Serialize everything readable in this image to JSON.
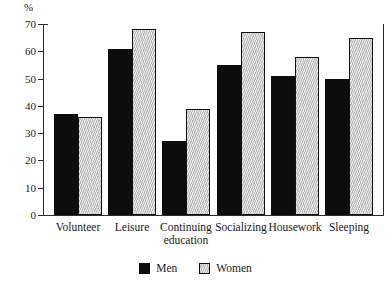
{
  "chart_data": {
    "type": "bar",
    "title": "",
    "subtitle": "",
    "xlabel": "",
    "ylabel": "%",
    "ylim": [
      0,
      70
    ],
    "ytick_labels": [
      "0",
      "10",
      "20",
      "30",
      "40",
      "50",
      "60",
      "70"
    ],
    "ytick_values": [
      0,
      10,
      20,
      30,
      40,
      50,
      60,
      70
    ],
    "grid": false,
    "legend_position": "bottom-center",
    "categories": [
      "Volunteer",
      "Leisure",
      "Continuing education",
      "Socializing",
      "Housework",
      "Sleeping"
    ],
    "category_lines": [
      [
        "Volunteer",
        ""
      ],
      [
        "Leisure",
        ""
      ],
      [
        "Continuing",
        "education"
      ],
      [
        "Socializing",
        ""
      ],
      [
        "Housework",
        ""
      ],
      [
        "Sleeping",
        ""
      ]
    ],
    "series": [
      {
        "name": "Men",
        "color": "#0d0d0d",
        "values": [
          37,
          61,
          27,
          55,
          51,
          50
        ]
      },
      {
        "name": "Women",
        "color": "#c9c9c9",
        "values": [
          36,
          68,
          39,
          67,
          58,
          65
        ]
      }
    ]
  },
  "legend": {
    "items": [
      {
        "label": "Men",
        "swatch": "black-square-swatch"
      },
      {
        "label": "Women",
        "swatch": "gray-square-swatch"
      }
    ]
  },
  "axis": {
    "y_unit": "%"
  }
}
